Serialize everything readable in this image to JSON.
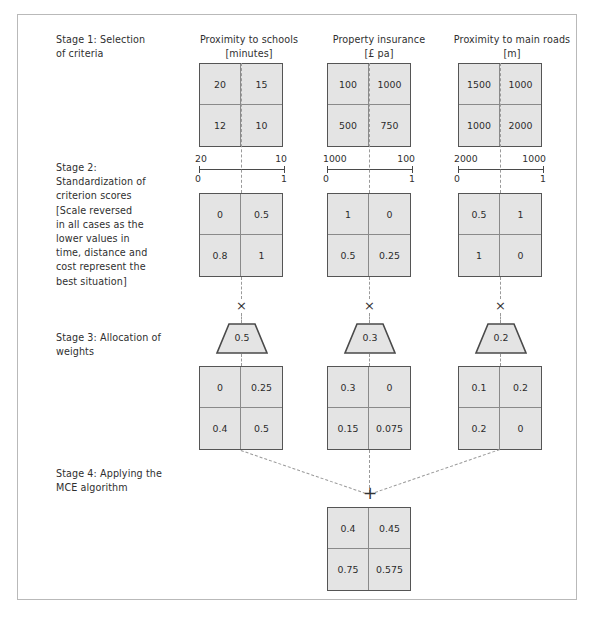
{
  "figure": {
    "stages": [
      {
        "id": "stage1",
        "label": "Stage 1: Selection\nof criteria"
      },
      {
        "id": "stage2",
        "label": "Stage 2:\nStandardization of\ncriterion scores\n[Scale reversed\nin all cases as the\nlower values in\ntime, distance and\ncost represent the\nbest situation]"
      },
      {
        "id": "stage3",
        "label": "Stage 3: Allocation of\nweights"
      },
      {
        "id": "stage4",
        "label": "Stage 4: Applying the\nMCE algorithm"
      }
    ],
    "criteria": [
      {
        "id": "schools",
        "name": "Proximity to schools",
        "unit": "[minutes]",
        "header": "Proximity to schools\n[minutes]"
      },
      {
        "id": "insurance",
        "name": "Property insurance",
        "unit": "[£ pa]",
        "header": "Property insurance\n[£ pa]"
      },
      {
        "id": "roads",
        "name": "Proximity to main roads",
        "unit": "[m]",
        "header": "Proximity to main roads\n[m]"
      }
    ],
    "raw_matrices": [
      {
        "criterion": "schools",
        "cells": [
          "20",
          "15",
          "12",
          "10"
        ]
      },
      {
        "criterion": "insurance",
        "cells": [
          "100",
          "1000",
          "500",
          "750"
        ]
      },
      {
        "criterion": "roads",
        "cells": [
          "1500",
          "1000",
          "1000",
          "2000"
        ]
      }
    ],
    "scales": [
      {
        "criterion": "schools",
        "raw_left": "20",
        "raw_right": "10",
        "std_left": "0",
        "std_right": "1"
      },
      {
        "criterion": "insurance",
        "raw_left": "1000",
        "raw_right": "100",
        "std_left": "0",
        "std_right": "1"
      },
      {
        "criterion": "roads",
        "raw_left": "2000",
        "raw_right": "1000",
        "std_left": "0",
        "std_right": "1"
      }
    ],
    "standardized_matrices": [
      {
        "criterion": "schools",
        "cells": [
          "0",
          "0.5",
          "0.8",
          "1"
        ]
      },
      {
        "criterion": "insurance",
        "cells": [
          "1",
          "0",
          "0.5",
          "0.25"
        ]
      },
      {
        "criterion": "roads",
        "cells": [
          "0.5",
          "1",
          "1",
          "0"
        ]
      }
    ],
    "multiply_symbol": "×",
    "add_symbol": "+",
    "weights": [
      {
        "criterion": "schools",
        "value": "0.5"
      },
      {
        "criterion": "insurance",
        "value": "0.3"
      },
      {
        "criterion": "roads",
        "value": "0.2"
      }
    ],
    "weighted_matrices": [
      {
        "criterion": "schools",
        "cells": [
          "0",
          "0.25",
          "0.4",
          "0.5"
        ]
      },
      {
        "criterion": "insurance",
        "cells": [
          "0.3",
          "0",
          "0.15",
          "0.075"
        ]
      },
      {
        "criterion": "roads",
        "cells": [
          "0.1",
          "0.2",
          "0.2",
          "0"
        ]
      }
    ],
    "result_matrix": {
      "cells": [
        "0.4",
        "0.45",
        "0.75",
        "0.575"
      ]
    },
    "colors": {
      "cell_fill": "#e4e4e4",
      "matrix_border": "#555555",
      "inner_grid": "#8a8a8a",
      "dash": "#9a9a9a",
      "frame": "#b9b9b9",
      "text": "#2b2b2b"
    }
  }
}
